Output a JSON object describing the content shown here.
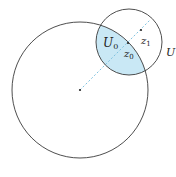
{
  "diagram": {
    "big_circle": {
      "cx": 80,
      "cy": 90,
      "r": 68
    },
    "small_circle": {
      "cx": 129,
      "cy": 42,
      "r": 33
    },
    "fill_color": "#c9e8f5",
    "line_color": "#3a3a3a",
    "dashed_line_color": "#7fc3e0",
    "labels": {
      "U0": "U",
      "U0_sub": "0",
      "z0": "z",
      "z0_sub": "0",
      "z1": "z",
      "z1_sub": "1",
      "U": "U"
    }
  }
}
